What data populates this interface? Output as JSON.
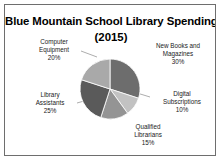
{
  "frame": {
    "border_color": "#6e6e6e",
    "background": "#ffffff"
  },
  "chart_data": {
    "type": "pie",
    "title": "Blue Mountain School Library Spending",
    "subtitle": "(2015)",
    "xlabel": "",
    "ylabel": "",
    "legend_position": "none",
    "labels_outside": true,
    "start_angle_deg": 0,
    "direction": "clockwise",
    "categories": [
      "New Books and Magazines",
      "Digital Subscriptions",
      "Qualified Librarians",
      "Library Assistants",
      "Computer Equipment"
    ],
    "values": [
      30,
      10,
      15,
      25,
      20
    ],
    "units": "percent",
    "slices": [
      {
        "name": "New Books and Magazines",
        "label_line_1": "New Books and",
        "label_line_2": "Magazines",
        "value": 30,
        "percent_label": "30%",
        "color": "#6d6d6d"
      },
      {
        "name": "Digital Subscriptions",
        "label_line_1": "Digital",
        "label_line_2": "Subscriptions",
        "value": 10,
        "percent_label": "10%",
        "color": "#c2c2c2"
      },
      {
        "name": "Qualified Librarians",
        "label_line_1": "Qualified",
        "label_line_2": "Librarians",
        "value": 15,
        "percent_label": "15%",
        "color": "#949494"
      },
      {
        "name": "Library Assistants",
        "label_line_1": "Library",
        "label_line_2": "Assistants",
        "value": 25,
        "percent_label": "25%",
        "color": "#5a5a5a"
      },
      {
        "name": "Computer Equipment",
        "label_line_1": "Computer",
        "label_line_2": "Equipment",
        "value": 20,
        "percent_label": "20%",
        "color": "#a9a9a9"
      }
    ],
    "leader_line_color": "#8a8a8a"
  }
}
